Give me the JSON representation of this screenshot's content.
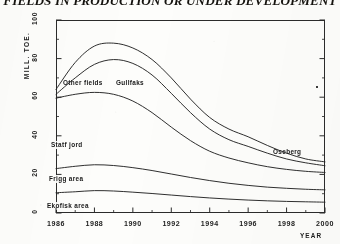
{
  "chart_data": {
    "type": "line",
    "title": "FIELDS IN PRODUCTION OR UNDER DEVELOPMENT",
    "xlabel": "YEAR",
    "ylabel": "MILL. TOE.",
    "xlim": [
      1986,
      2000
    ],
    "ylim": [
      0,
      100
    ],
    "grid": false,
    "legend_position": "inline-annotations",
    "stacked": true,
    "note": "Cumulative stacked curves; each plotted line is the running total of the fields at and below it.",
    "x_ticks": [
      "1986",
      "1988",
      "1990",
      "1992",
      "1994",
      "1996",
      "1998",
      "2000"
    ],
    "x_tick_values": [
      1986,
      1988,
      1990,
      1992,
      1994,
      1996,
      1998,
      2000
    ],
    "x_minor_step": 1,
    "y_ticks": [
      "0",
      "20",
      "40",
      "60",
      "80",
      "100"
    ],
    "y_tick_values": [
      0,
      20,
      40,
      60,
      80,
      100
    ],
    "y_minor_step": 10,
    "x": [
      1986,
      1987,
      1988,
      1989,
      1990,
      1991,
      1992,
      1993,
      1994,
      1995,
      1996,
      1997,
      1998,
      1999,
      2000
    ],
    "series": [
      {
        "name": "Ekofisk area",
        "label": "Ekofisk area",
        "cumulative_values": [
          10.5,
          11.0,
          11.6,
          11.4,
          10.8,
          10.1,
          9.3,
          8.5,
          7.8,
          7.2,
          6.7,
          6.3,
          6.0,
          5.8,
          5.6
        ]
      },
      {
        "name": "Frigg area",
        "label": "Frigg area",
        "cumulative_values": [
          23.0,
          24.2,
          25.0,
          24.6,
          23.5,
          22.0,
          20.2,
          18.4,
          16.8,
          15.4,
          14.3,
          13.4,
          12.8,
          12.3,
          12.0
        ]
      },
      {
        "name": "Statfjord",
        "label": "Statf jord",
        "cumulative_values": [
          59.5,
          61.5,
          62.5,
          61.5,
          58.0,
          52.0,
          44.5,
          37.5,
          32.0,
          28.5,
          26.0,
          24.0,
          22.6,
          21.6,
          21.0
        ]
      },
      {
        "name": "Gullfaks",
        "label": "Gullfaks",
        "cumulative_values": [
          61.5,
          70.0,
          77.0,
          79.5,
          77.5,
          71.5,
          62.0,
          52.0,
          43.5,
          38.0,
          34.5,
          31.0,
          28.0,
          26.0,
          24.5
        ]
      },
      {
        "name": "Other fields",
        "label": "Other fields",
        "cumulative_values": [
          64.0,
          78.0,
          86.5,
          88.0,
          85.5,
          79.5,
          70.0,
          59.0,
          49.5,
          43.5,
          39.5,
          35.0,
          31.0,
          28.0,
          26.5
        ]
      }
    ]
  },
  "annotations": [
    {
      "id": "other-fields",
      "text": "Other fields"
    },
    {
      "id": "gullfaks",
      "text": "Gullfaks"
    },
    {
      "id": "statfjord",
      "text": "Statf jord"
    },
    {
      "id": "frigg-area",
      "text": "Frigg area"
    },
    {
      "id": "ekofisk-area",
      "text": "Ekofisk area"
    }
  ],
  "colors": {
    "ink": "#242424",
    "paper": "#fdfdfb",
    "frame": "#2b2b2b"
  }
}
